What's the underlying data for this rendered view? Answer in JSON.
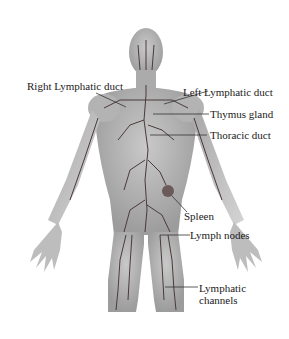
{
  "diagram": {
    "labels": [
      {
        "id": "right-lymphatic-duct",
        "text": "Right Lymphatic duct"
      },
      {
        "id": "left-lymphatic-duct",
        "text": "Left Lymphatic duct"
      },
      {
        "id": "thymus-gland",
        "text": "Thymus gland"
      },
      {
        "id": "thoracic-duct",
        "text": "Thoracic duct"
      },
      {
        "id": "spleen",
        "text": "Spleen"
      },
      {
        "id": "lymph-nodes",
        "text": "Lymph nodes"
      },
      {
        "id": "lymphatic-channels-line1",
        "text": "Lymphatic"
      },
      {
        "id": "lymphatic-channels-line2",
        "text": "channels"
      }
    ],
    "colors": {
      "body": "#b9b9b9",
      "body_shade": "#9a9a9a",
      "vessels": "#4a3a3a",
      "label_text": "#1a1a1a",
      "leader_line": "#333333"
    }
  }
}
